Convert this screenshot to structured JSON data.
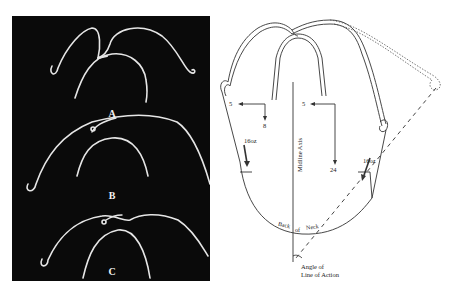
{
  "figure": {
    "left_panel": {
      "background": "#0a0a0a",
      "wire_color": "#e8e8e8",
      "labels": [
        "A",
        "B",
        "C"
      ]
    },
    "right_diagram": {
      "line_color": "#333333",
      "force_labels": {
        "left_horizontal": "5",
        "left_vertical": "8",
        "right_horizontal": "5",
        "right_vertical": "24",
        "left_strap": "16oz",
        "right_strap": "16oz"
      },
      "axis_label": "Midline Axis",
      "neck_label": {
        "word1": "Back",
        "word2": "of",
        "word3": "Neck"
      },
      "angle_label": {
        "line1": "Angle of",
        "line2": "Line of Action"
      }
    }
  }
}
